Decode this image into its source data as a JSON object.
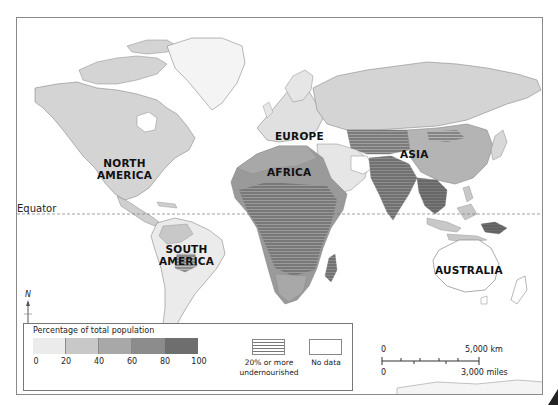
{
  "map": {
    "title": "",
    "colors": {
      "band_0_20": "#ebebeb",
      "band_20_40": "#c8c8c8",
      "band_40_60": "#a8a8a8",
      "band_60_80": "#8c8c8c",
      "band_80_100": "#6e6e6e",
      "no_data": "#ffffff",
      "frame": "#8a8a8a",
      "equator_line": "#777777"
    },
    "region_labels": {
      "north_america_line1": "NORTH",
      "north_america_line2": "AMERICA",
      "south_america_line1": "SOUTH",
      "south_america_line2": "AMERICA",
      "europe": "EUROPE",
      "africa": "AFRICA",
      "asia": "ASIA",
      "australia": "AUSTRALIA"
    },
    "equator_label": "Equator",
    "north_arrow_label": "N"
  },
  "legend": {
    "title": "Percentage of total population",
    "ticks": [
      "0",
      "20",
      "40",
      "60",
      "80",
      "100"
    ],
    "bands": [
      {
        "range": "0-20",
        "color": "#ebebeb"
      },
      {
        "range": "20-40",
        "color": "#c8c8c8"
      },
      {
        "range": "40-60",
        "color": "#a8a8a8"
      },
      {
        "range": "60-80",
        "color": "#8c8c8c"
      },
      {
        "range": "80-100",
        "color": "#6e6e6e"
      }
    ],
    "hatch_label_line1": "20% or more",
    "hatch_label_line2": "undernourished",
    "no_data_label": "No data"
  },
  "scale_bar": {
    "top_start": "0",
    "top_end": "5,000 km",
    "bottom_start": "0",
    "bottom_end": "3,000 miles"
  }
}
